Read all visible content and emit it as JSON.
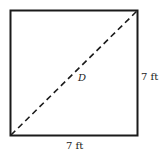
{
  "diagram": {
    "shape": "square",
    "diagonal_label": "D",
    "right_side_label": "7 ft",
    "bottom_side_label": "7 ft",
    "stroke_color": "#1a1a1a"
  }
}
